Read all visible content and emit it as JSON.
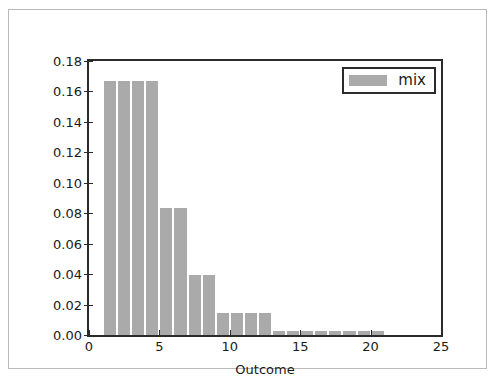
{
  "chart_data": {
    "type": "bar",
    "title": "",
    "xlabel": "Outcome",
    "ylabel": "Probability",
    "xlim": [
      0,
      25
    ],
    "ylim": [
      0.0,
      0.18
    ],
    "grid": false,
    "legend_position": "upper right",
    "bar_color": "#aaaaaa",
    "bar_edge_color": "#ffffff",
    "axis_color": "#2b2b2b",
    "background_color": "#ffffff",
    "xticks": [
      0,
      5,
      10,
      15,
      20,
      25
    ],
    "xtick_labels": [
      "0",
      "5",
      "10",
      "15",
      "20",
      "25"
    ],
    "yticks": [
      0.0,
      0.02,
      0.04,
      0.06,
      0.08,
      0.1,
      0.12,
      0.14,
      0.16,
      0.18
    ],
    "ytick_labels": [
      "0.00",
      "0.02",
      "0.04",
      "0.06",
      "0.08",
      "0.10",
      "0.12",
      "0.14",
      "0.16",
      "0.18"
    ],
    "bar_width": 1.0,
    "bar_align": "edge",
    "series": [
      {
        "name": "mix",
        "x": [
          1,
          2,
          3,
          4,
          5,
          6,
          7,
          8,
          9,
          10,
          11,
          12,
          13,
          14,
          15,
          16,
          17,
          18,
          19,
          20
        ],
        "values": [
          0.1667,
          0.1667,
          0.1667,
          0.1667,
          0.0833,
          0.0833,
          0.0397,
          0.0397,
          0.0145,
          0.0145,
          0.0145,
          0.0145,
          0.0028,
          0.0028,
          0.0028,
          0.0028,
          0.0028,
          0.0028,
          0.0028,
          0.0028
        ]
      }
    ]
  },
  "legend": {
    "entries": [
      {
        "label": "mix",
        "color": "#aaaaaa"
      }
    ]
  }
}
